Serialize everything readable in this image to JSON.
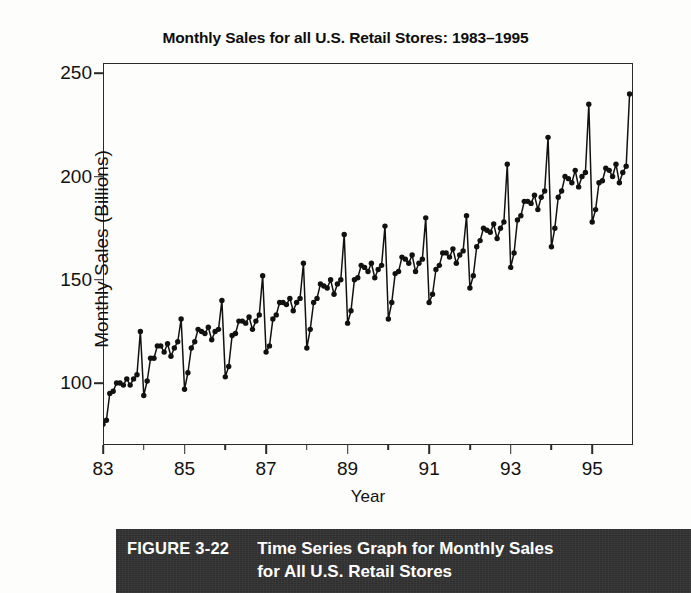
{
  "figure": {
    "number_label": "FIGURE 3-22",
    "caption": "Time Series Graph for Monthly Sales\nfor All U.S. Retail Stores"
  },
  "chart_data": {
    "type": "line",
    "title": "Monthly Sales for all U.S. Retail Stores: 1983–1995",
    "xlabel": "Year",
    "ylabel": "Monthly Sales (Billions)",
    "xlim": [
      1983.0,
      1996.0
    ],
    "ylim": [
      70,
      255
    ],
    "yticks": [
      100,
      150,
      200,
      250
    ],
    "ytick_labels": [
      "100",
      "150",
      "200",
      "250"
    ],
    "xticks": [
      1983,
      1984,
      1985,
      1986,
      1987,
      1988,
      1989,
      1990,
      1991,
      1992,
      1993,
      1994,
      1995
    ],
    "xtick_labels": [
      "83",
      "",
      "85",
      "",
      "87",
      "",
      "89",
      "",
      "91",
      "",
      "93",
      "",
      "95"
    ],
    "grid": false,
    "legend": false,
    "marker": "filled-circle",
    "line_color": "#111111",
    "marker_color": "#111111",
    "series": [
      {
        "name": "Monthly Sales (Billions)",
        "x_start": 1983.0,
        "x_step": 0.08333,
        "values": [
          80,
          82,
          95,
          96,
          100,
          100,
          99,
          102,
          99,
          102,
          104,
          125,
          94,
          101,
          112,
          112,
          118,
          118,
          115,
          119,
          113,
          117,
          120,
          131,
          97,
          105,
          117,
          120,
          126,
          125,
          124,
          127,
          121,
          125,
          126,
          140,
          103,
          108,
          123,
          124,
          130,
          130,
          129,
          132,
          126,
          130,
          133,
          152,
          115,
          118,
          131,
          133,
          139,
          139,
          138,
          141,
          135,
          139,
          141,
          158,
          117,
          126,
          139,
          141,
          148,
          147,
          146,
          150,
          143,
          148,
          150,
          172,
          129,
          135,
          150,
          151,
          157,
          156,
          154,
          158,
          151,
          155,
          157,
          176,
          131,
          139,
          153,
          154,
          161,
          160,
          158,
          162,
          154,
          158,
          160,
          180,
          139,
          143,
          155,
          157,
          163,
          163,
          161,
          165,
          158,
          162,
          164,
          181,
          146,
          152,
          166,
          169,
          175,
          174,
          173,
          177,
          170,
          175,
          178,
          206,
          156,
          163,
          179,
          181,
          188,
          188,
          187,
          191,
          184,
          190,
          193,
          219,
          166,
          175,
          190,
          193,
          200,
          199,
          197,
          203,
          195,
          200,
          202,
          235,
          178,
          184,
          197,
          198,
          204,
          203,
          200,
          206,
          197,
          202,
          205,
          240
        ]
      }
    ],
    "annotations": [
      "Strong annual seasonality: December peak, January trough",
      "Steady upward trend from about 80 billion in 1983 to about 240 billion in 1995"
    ]
  }
}
